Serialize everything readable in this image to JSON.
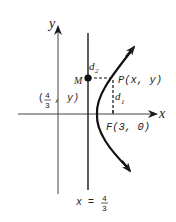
{
  "diagram": {
    "type": "parabola-focus-directrix",
    "colors": {
      "ink": "#1a1a1a",
      "axis": "#333333",
      "background": "#ffffff"
    },
    "axes": {
      "x_label": "x",
      "y_label": "y"
    },
    "directrix": {
      "label_prefix": "x =",
      "value_num": "4",
      "value_den": "3"
    },
    "point_M": {
      "label": "M"
    },
    "point_P": {
      "label": "P(x, y)"
    },
    "focus": {
      "label": "F(3, 0)"
    },
    "projection": {
      "open": "(",
      "num": "4",
      "den": "3",
      "rest": ",  y)"
    },
    "distances": {
      "d1": {
        "base": "d",
        "sub": "1"
      },
      "d2": {
        "base": "d",
        "sub": "2"
      }
    }
  }
}
